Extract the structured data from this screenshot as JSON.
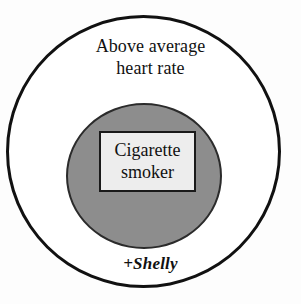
{
  "diagram": {
    "type": "euler-venn-subset",
    "background_color": "#fdfdfd",
    "outer_set": {
      "name": "above-average-heart-rate",
      "label_lines": [
        "Above average",
        "heart rate"
      ],
      "fill_color": "#ffffff",
      "stroke_color": "#111111"
    },
    "inner_set": {
      "name": "cigarette-smoker",
      "fill_color": "#8d8d8d",
      "stroke_color": "#2b2b2b",
      "label_box": {
        "label_lines": [
          "Cigarette",
          "smoker"
        ],
        "fill_color": "#ededed",
        "stroke_color": "#1a1a1a"
      }
    },
    "member_annotation": {
      "name": "shelly",
      "text": "+Shelly",
      "region": "outer_set_only"
    }
  }
}
